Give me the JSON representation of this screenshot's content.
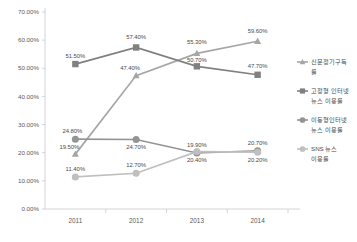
{
  "chart_data": {
    "type": "line",
    "title": "",
    "xlabel": "",
    "ylabel": "",
    "categories": [
      "2011",
      "2012",
      "2013",
      "2014"
    ],
    "ylim": [
      0,
      70
    ],
    "ytick_labels": [
      "0.00%",
      "10.00%",
      "20.00%",
      "30.00%",
      "40.00%",
      "50.00%",
      "60.00%",
      "70.00%"
    ],
    "ytick_values": [
      0,
      10,
      20,
      30,
      40,
      50,
      60,
      70
    ],
    "grid": false,
    "legend_position": "right",
    "series": [
      {
        "name": "신문정기구독률",
        "marker": "triangle",
        "color": "#a6a6a6",
        "values": [
          19.5,
          47.4,
          55.3,
          59.6
        ],
        "labels": [
          "19.50%",
          "47.40%",
          "55.30%",
          "59.60%"
        ]
      },
      {
        "name": "고정형 인터넷 뉴스 이용률",
        "marker": "square",
        "color": "#808080",
        "values": [
          51.5,
          57.4,
          50.7,
          47.7
        ],
        "labels": [
          "51.50%",
          "57.40%",
          "50.70%",
          "47.70%"
        ]
      },
      {
        "name": "이동형 인터넷 뉴스 이용률",
        "marker": "circle",
        "color": "#949494",
        "values": [
          24.8,
          24.7,
          19.9,
          20.7
        ],
        "labels": [
          "24.80%",
          "24.70%",
          "19.90%",
          "20.70%"
        ]
      },
      {
        "name": "SNS 뉴스 이용률",
        "marker": "circle",
        "color": "#bfbfbf",
        "values": [
          11.4,
          12.7,
          20.4,
          20.2
        ],
        "labels": [
          "11.40%",
          "12.70%",
          "20.40%",
          "20.20%"
        ]
      }
    ]
  },
  "legend": {
    "items": [
      {
        "label_line1": "신문정기구독",
        "label_line2": "률"
      },
      {
        "label_line1": "고정형 인터넷",
        "label_line2": "뉴스 이용률"
      },
      {
        "label_line1": "이동형인터넷",
        "label_line2": "뉴스 이용률"
      },
      {
        "label_line1": "SNS 뉴스",
        "label_line2": "이용률"
      }
    ]
  },
  "colors": {
    "series_1": "#a6a6a6",
    "series_2": "#808080",
    "series_3": "#949494",
    "series_4": "#bfbfbf",
    "axis": "#c9c9c9",
    "text": "#5a5a5a",
    "background": "#ffffff"
  }
}
